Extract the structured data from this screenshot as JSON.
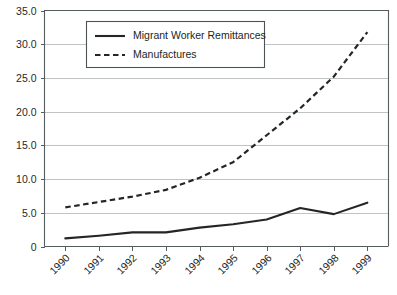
{
  "chart_data": {
    "type": "line",
    "title": "",
    "subtitle": "",
    "xlabel": "",
    "ylabel": "",
    "categories": [
      "1990",
      "1991",
      "1992",
      "1993",
      "1994",
      "1995",
      "1996",
      "1997",
      "1998",
      "1999"
    ],
    "x": [
      1990,
      1991,
      1992,
      1993,
      1994,
      1995,
      1996,
      1997,
      1998,
      1999
    ],
    "series": [
      {
        "name": "Migrant Worker Remittances",
        "style": "solid",
        "color": "#232526",
        "values": [
          1.2,
          1.6,
          2.1,
          2.1,
          2.8,
          3.3,
          4.0,
          5.7,
          4.8,
          6.5
        ]
      },
      {
        "name": "Manufactures",
        "style": "dashed",
        "color": "#232526",
        "values": [
          5.8,
          6.6,
          7.4,
          8.4,
          10.2,
          12.5,
          16.5,
          20.5,
          25.2,
          31.8
        ]
      }
    ],
    "ylim": [
      0,
      35
    ],
    "ytick_values": [
      0,
      5,
      10,
      15,
      20,
      25,
      30,
      35
    ],
    "ytick_labels": [
      "0",
      "5.0",
      "10.0",
      "15.0",
      "20.0",
      "25.0",
      "30.0",
      "35.0"
    ],
    "grid": true,
    "grid_axis": "y",
    "legend": {
      "position": "top-center",
      "entries": [
        {
          "label": "Migrant Worker Remittances",
          "style": "solid"
        },
        {
          "label": "Manufactures",
          "style": "dashed"
        }
      ]
    },
    "xtick_rotation": -45,
    "annotations": []
  }
}
